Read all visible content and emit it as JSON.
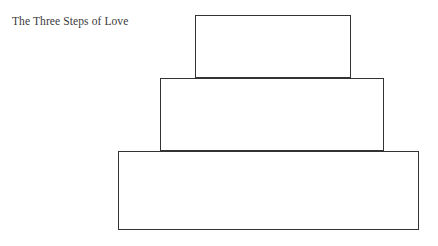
{
  "page": {
    "width": 438,
    "height": 246,
    "background_color": "#ffffff",
    "stroke_color": "#333333",
    "text_color": "#3a3a3a"
  },
  "diagram": {
    "title": "The Three Steps of Love",
    "type": "stacked-pyramid",
    "steps": [
      {
        "index": 1,
        "label": "",
        "position": "top",
        "x": 195,
        "y": 15,
        "width": 156,
        "height": 63
      },
      {
        "index": 2,
        "label": "",
        "position": "middle",
        "x": 160,
        "y": 78,
        "width": 224,
        "height": 73
      },
      {
        "index": 3,
        "label": "",
        "position": "bottom",
        "x": 118,
        "y": 151,
        "width": 301,
        "height": 79
      }
    ]
  }
}
